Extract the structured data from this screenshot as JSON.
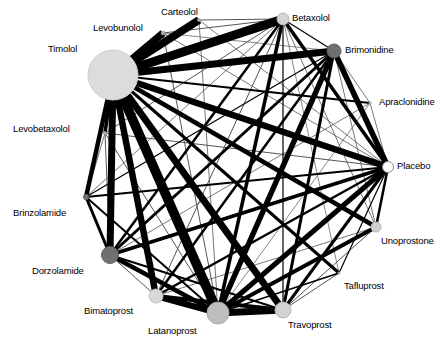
{
  "figure": {
    "type": "network-meta-analysis-graph",
    "width": 446,
    "height": 346,
    "background": "#ffffff",
    "node_fill_light": "#d9d9d9",
    "node_fill_mid": "#bfbfbf",
    "node_fill_dark": "#808080",
    "node_fill_white": "#ffffff",
    "node_stroke": "#999999",
    "edge_color": "#000000",
    "edge_color_thin": "#555555"
  },
  "chart_data": {
    "type": "network",
    "title": "",
    "xlabel": "",
    "ylabel": "",
    "layout": "circular",
    "nodes": [
      {
        "id": "timolol",
        "label": "Timolol",
        "x": 113,
        "y": 75,
        "r": 25.0,
        "fill": "#dcdcdc",
        "stroke": "#cfcfcf",
        "label_x": 48,
        "label_y": 44,
        "label_align": "left"
      },
      {
        "id": "levobunolol",
        "label": "Levobunolol",
        "x": 163,
        "y": 33,
        "r": 2.0,
        "fill": "#b0b0b0",
        "stroke": "#999999",
        "label_x": 93,
        "label_y": 23,
        "label_align": "left"
      },
      {
        "id": "carteolol",
        "label": "Carteolol",
        "x": 199,
        "y": 20,
        "r": 1.6,
        "fill": "#b0b0b0",
        "stroke": "#999999",
        "label_x": 161,
        "label_y": 7,
        "label_align": "left"
      },
      {
        "id": "betaxolol",
        "label": "Betaxolol",
        "x": 283,
        "y": 19,
        "r": 6.0,
        "fill": "#d5d5d5",
        "stroke": "#bbbbbb",
        "label_x": 292,
        "label_y": 13,
        "label_align": "left"
      },
      {
        "id": "brimonidine",
        "label": "Brimonidine",
        "x": 334,
        "y": 51,
        "r": 7.0,
        "fill": "#6f6f6f",
        "stroke": "#606060",
        "label_x": 345,
        "label_y": 45,
        "label_align": "left"
      },
      {
        "id": "apraclonidine",
        "label": "Apraclonidine",
        "x": 370,
        "y": 103,
        "r": 1.2,
        "fill": "#b0b0b0",
        "stroke": "#999999",
        "label_x": 379,
        "label_y": 97,
        "label_align": "left"
      },
      {
        "id": "placebo",
        "label": "Placebo",
        "x": 388,
        "y": 167,
        "r": 5.5,
        "fill": "#ffffff",
        "stroke": "#8c8c8c",
        "label_x": 397,
        "label_y": 161,
        "label_align": "left"
      },
      {
        "id": "unoprostone",
        "label": "Unoprostone",
        "x": 376,
        "y": 227,
        "r": 5.0,
        "fill": "#cfcfcf",
        "stroke": "#b5b5b5",
        "label_x": 381,
        "label_y": 236,
        "label_align": "left"
      },
      {
        "id": "tafluprost",
        "label": "Tafluprost",
        "x": 339,
        "y": 273,
        "r": 1.2,
        "fill": "#b0b0b0",
        "stroke": "#999999",
        "label_x": 344,
        "label_y": 281,
        "label_align": "left"
      },
      {
        "id": "travoprost",
        "label": "Travoprost",
        "x": 283,
        "y": 310,
        "r": 8.0,
        "fill": "#d2d2d2",
        "stroke": "#b8b8b8",
        "label_x": 288,
        "label_y": 320,
        "label_align": "left"
      },
      {
        "id": "latanoprost",
        "label": "Latanoprost",
        "x": 218,
        "y": 313,
        "r": 11.0,
        "fill": "#bdbdbd",
        "stroke": "#a8a8a8",
        "label_x": 148,
        "label_y": 326,
        "label_align": "left"
      },
      {
        "id": "bimatoprost",
        "label": "Bimatoprost",
        "x": 156,
        "y": 296,
        "r": 7.0,
        "fill": "#d8d8d8",
        "stroke": "#bfbfbf",
        "label_x": 84,
        "label_y": 306,
        "label_align": "left"
      },
      {
        "id": "dorzolamide",
        "label": "Dorzolamide",
        "x": 110,
        "y": 255,
        "r": 8.5,
        "fill": "#707070",
        "stroke": "#606060",
        "label_x": 32,
        "label_y": 266,
        "label_align": "left"
      },
      {
        "id": "brinzolamide",
        "label": "Brinzolamide",
        "x": 86,
        "y": 197,
        "r": 2.8,
        "fill": "#707070",
        "stroke": "#606060",
        "label_x": 13,
        "label_y": 208,
        "label_align": "left"
      },
      {
        "id": "levobetaxolol",
        "label": "Levobetaxolol",
        "x": 105,
        "y": 133,
        "r": 1.6,
        "fill": "#b0b0b0",
        "stroke": "#999999",
        "label_x": 13,
        "label_y": 124,
        "label_align": "left"
      }
    ],
    "edges": [
      {
        "source": "timolol",
        "target": "levobunolol",
        "width": 7.5
      },
      {
        "source": "timolol",
        "target": "carteolol",
        "width": 8.0
      },
      {
        "source": "timolol",
        "target": "betaxolol",
        "width": 9.0
      },
      {
        "source": "timolol",
        "target": "brimonidine",
        "width": 7.0
      },
      {
        "source": "timolol",
        "target": "apraclonidine",
        "width": 2.0
      },
      {
        "source": "timolol",
        "target": "placebo",
        "width": 6.5
      },
      {
        "source": "timolol",
        "target": "unoprostone",
        "width": 4.5
      },
      {
        "source": "timolol",
        "target": "tafluprost",
        "width": 3.0
      },
      {
        "source": "timolol",
        "target": "travoprost",
        "width": 7.0
      },
      {
        "source": "timolol",
        "target": "latanoprost",
        "width": 9.5
      },
      {
        "source": "timolol",
        "target": "bimatoprost",
        "width": 6.5
      },
      {
        "source": "timolol",
        "target": "dorzolamide",
        "width": 7.0
      },
      {
        "source": "timolol",
        "target": "brinzolamide",
        "width": 4.5
      },
      {
        "source": "timolol",
        "target": "levobetaxolol",
        "width": 3.5
      },
      {
        "source": "levobunolol",
        "target": "betaxolol",
        "width": 1.0
      },
      {
        "source": "levobunolol",
        "target": "placebo",
        "width": 0.8
      },
      {
        "source": "levobunolol",
        "target": "latanoprost",
        "width": 1.0
      },
      {
        "source": "levobunolol",
        "target": "brimonidine",
        "width": 0.7
      },
      {
        "source": "carteolol",
        "target": "betaxolol",
        "width": 1.0
      },
      {
        "source": "carteolol",
        "target": "placebo",
        "width": 0.8
      },
      {
        "source": "carteolol",
        "target": "latanoprost",
        "width": 0.8
      },
      {
        "source": "betaxolol",
        "target": "brimonidine",
        "width": 1.2
      },
      {
        "source": "betaxolol",
        "target": "placebo",
        "width": 3.5
      },
      {
        "source": "betaxolol",
        "target": "latanoprost",
        "width": 3.5
      },
      {
        "source": "betaxolol",
        "target": "travoprost",
        "width": 1.2
      },
      {
        "source": "betaxolol",
        "target": "dorzolamide",
        "width": 2.5
      },
      {
        "source": "betaxolol",
        "target": "bimatoprost",
        "width": 1.0
      },
      {
        "source": "betaxolol",
        "target": "unoprostone",
        "width": 0.8
      },
      {
        "source": "betaxolol",
        "target": "brinzolamide",
        "width": 0.8
      },
      {
        "source": "betaxolol",
        "target": "levobetaxolol",
        "width": 1.0
      },
      {
        "source": "betaxolol",
        "target": "tafluprost",
        "width": 0.7
      },
      {
        "source": "brimonidine",
        "target": "placebo",
        "width": 5.5
      },
      {
        "source": "brimonidine",
        "target": "latanoprost",
        "width": 5.5
      },
      {
        "source": "brimonidine",
        "target": "travoprost",
        "width": 3.0
      },
      {
        "source": "brimonidine",
        "target": "dorzolamide",
        "width": 3.0
      },
      {
        "source": "brimonidine",
        "target": "bimatoprost",
        "width": 2.5
      },
      {
        "source": "brimonidine",
        "target": "brinzolamide",
        "width": 1.2
      },
      {
        "source": "brimonidine",
        "target": "unoprostone",
        "width": 0.8
      },
      {
        "source": "brimonidine",
        "target": "apraclonidine",
        "width": 0.8
      },
      {
        "source": "apraclonidine",
        "target": "placebo",
        "width": 0.8
      },
      {
        "source": "apraclonidine",
        "target": "dorzolamide",
        "width": 0.8
      },
      {
        "source": "apraclonidine",
        "target": "latanoprost",
        "width": 0.7
      },
      {
        "source": "placebo",
        "target": "unoprostone",
        "width": 2.5
      },
      {
        "source": "placebo",
        "target": "tafluprost",
        "width": 1.2
      },
      {
        "source": "placebo",
        "target": "travoprost",
        "width": 3.0
      },
      {
        "source": "placebo",
        "target": "latanoprost",
        "width": 5.0
      },
      {
        "source": "placebo",
        "target": "bimatoprost",
        "width": 2.5
      },
      {
        "source": "placebo",
        "target": "dorzolamide",
        "width": 3.5
      },
      {
        "source": "placebo",
        "target": "brinzolamide",
        "width": 2.0
      },
      {
        "source": "placebo",
        "target": "levobetaxolol",
        "width": 1.0
      },
      {
        "source": "unoprostone",
        "target": "latanoprost",
        "width": 4.0
      },
      {
        "source": "unoprostone",
        "target": "travoprost",
        "width": 1.0
      },
      {
        "source": "unoprostone",
        "target": "bimatoprost",
        "width": 0.8
      },
      {
        "source": "tafluprost",
        "target": "latanoprost",
        "width": 1.5
      },
      {
        "source": "tafluprost",
        "target": "travoprost",
        "width": 1.0
      },
      {
        "source": "travoprost",
        "target": "latanoprost",
        "width": 7.0
      },
      {
        "source": "travoprost",
        "target": "bimatoprost",
        "width": 4.0
      },
      {
        "source": "travoprost",
        "target": "dorzolamide",
        "width": 2.0
      },
      {
        "source": "latanoprost",
        "target": "bimatoprost",
        "width": 6.0
      },
      {
        "source": "latanoprost",
        "target": "dorzolamide",
        "width": 4.5
      },
      {
        "source": "latanoprost",
        "target": "brinzolamide",
        "width": 2.0
      },
      {
        "source": "latanoprost",
        "target": "levobetaxolol",
        "width": 1.0
      },
      {
        "source": "bimatoprost",
        "target": "dorzolamide",
        "width": 1.0
      },
      {
        "source": "dorzolamide",
        "target": "brinzolamide",
        "width": 3.0
      },
      {
        "source": "dorzolamide",
        "target": "levobetaxolol",
        "width": 1.0
      },
      {
        "source": "brinzolamide",
        "target": "levobetaxolol",
        "width": 0.8
      }
    ],
    "legend": []
  }
}
